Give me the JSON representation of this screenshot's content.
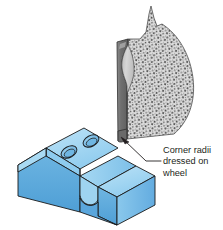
{
  "figure": {
    "background_color": "#ffffff",
    "callout": {
      "lines": [
        "Corner radii",
        "dressed on",
        "wheel"
      ],
      "text_color": "#231f20",
      "leader_color": "#231f20"
    },
    "grinding_wheel": {
      "label": "grinding-wheel",
      "abrasive_fill_color": "#d8d8d8",
      "speckle_color": "#4d4d4d",
      "profile_face_color": "#707070",
      "profile_radius_color": "#c8c8c8",
      "outline_color": "#231f20"
    },
    "workpiece": {
      "label": "slotted-block-workpiece",
      "top_face_color": "#9ed3f0",
      "front_face_color": "#5ba8dc",
      "side_face_color": "#7cc0e8",
      "slot_face_color": "#8fcaee",
      "hole_fill_color": "#7cc0e8",
      "outline_color": "#1a1a1a",
      "hole_count": 2
    }
  }
}
